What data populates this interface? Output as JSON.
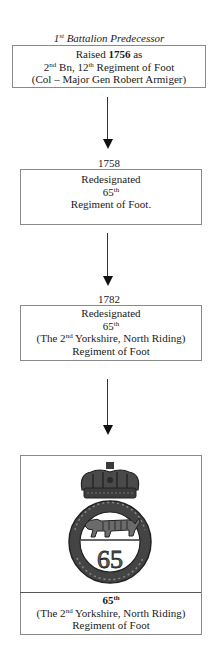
{
  "diagram": {
    "title": "1st Battalion Predecessor",
    "title_parts": {
      "base": "1",
      "sup": "st",
      "rest": " Battalion Predecessor"
    },
    "nodes": [
      {
        "id": "node-1756",
        "year_label": "",
        "lines": [
          {
            "pre": "Raised ",
            "bold": "1756",
            "post": " as"
          },
          {
            "n": "2",
            "sup": "nd",
            "mid": " Bn, 12",
            "sup2": "th",
            "post": " Regiment of Foot"
          },
          {
            "text": "(Col – Major Gen Robert Armiger)"
          }
        ]
      },
      {
        "id": "node-1758",
        "year_label": "1758",
        "lines": [
          {
            "text": "Redesignated"
          },
          {
            "n": "65",
            "sup": "th"
          },
          {
            "text": "Regiment of Foot."
          }
        ]
      },
      {
        "id": "node-1782",
        "year_label": "1782",
        "lines": [
          {
            "text": "Redesignated"
          },
          {
            "n": "65",
            "sup": "th"
          },
          {
            "pre": "(The 2",
            "sup": "nd",
            "post": " Yorkshire, North Riding)"
          },
          {
            "text": "Regiment of Foot"
          }
        ]
      },
      {
        "id": "node-badge",
        "image": "regimental-badge: crown above garter ring with tiger and numeral 65",
        "badge_numeral": "65",
        "lines": [
          {
            "n": "65",
            "sup": "th"
          },
          {
            "pre": "(The 2",
            "sup": "nd",
            "post": " Yorkshire, North Riding)"
          },
          {
            "text": "Regiment of Foot"
          }
        ]
      }
    ],
    "edges": [
      {
        "from": "node-1756",
        "to": "node-1758"
      },
      {
        "from": "node-1758",
        "to": "node-1782"
      },
      {
        "from": "node-1782",
        "to": "node-badge"
      }
    ]
  }
}
